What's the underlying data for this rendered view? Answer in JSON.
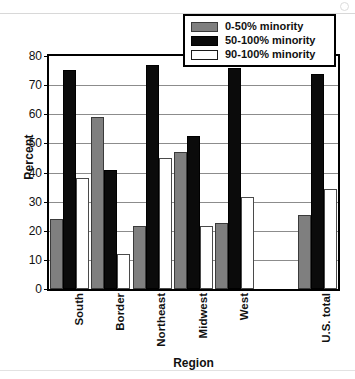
{
  "chart_data": {
    "type": "bar",
    "title": "",
    "xlabel": "Region",
    "ylabel": "Percent",
    "ylim": [
      0,
      80
    ],
    "ytick_values": [
      0,
      10,
      20,
      30,
      40,
      50,
      60,
      70,
      80
    ],
    "ytick_labels": [
      "0",
      "10",
      "20",
      "30",
      "40",
      "50",
      "60",
      "70",
      "80"
    ],
    "grid": true,
    "legend_position": "top-right",
    "categories": [
      "South",
      "Border",
      "Northeast",
      "Midwest",
      "West",
      "",
      "U.S. total"
    ],
    "series": [
      {
        "name": "0-50% minority",
        "color": "#7f7f7f",
        "values": [
          24,
          59,
          21.8,
          47,
          22.8,
          null,
          25.5
        ]
      },
      {
        "name": "50-100% minority",
        "color": "#0b0b0b",
        "values": [
          75.2,
          41,
          77,
          52.7,
          75.8,
          null,
          73.7
        ]
      },
      {
        "name": "90-100% minority",
        "color": "#ffffff",
        "values": [
          38,
          12,
          45,
          21.8,
          31.6,
          null,
          34.5
        ]
      }
    ]
  },
  "legend": {
    "items": [
      {
        "label": "0-50% minority"
      },
      {
        "label": "50-100% minority"
      },
      {
        "label": "90-100% minority"
      }
    ]
  }
}
